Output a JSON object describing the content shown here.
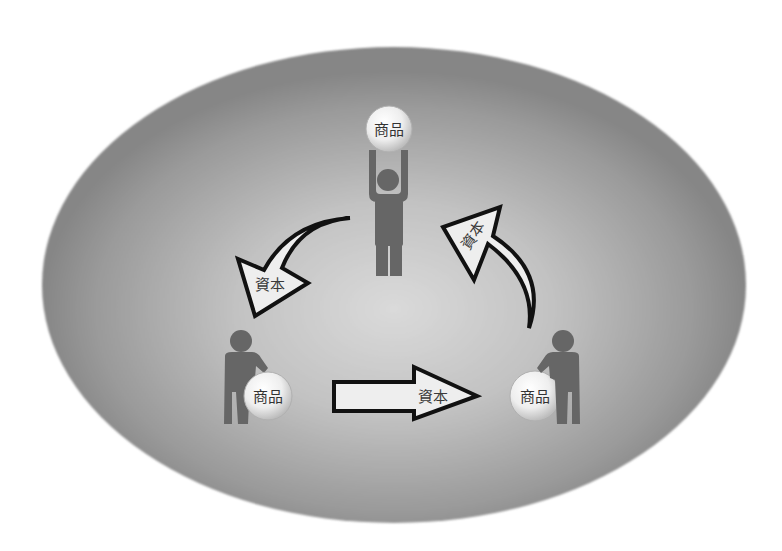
{
  "diagram": {
    "type": "circulation-of-capital-and-goods",
    "colors": {
      "background": "#ffffff",
      "ellipse_outer": "#8a8a8a",
      "ellipse_inner": "#d4d4d4",
      "figure": "#666666",
      "arrow_fill": "#eeeeee",
      "arrow_stroke": "#111111",
      "ball_fill": "#f2f2f2",
      "label_text": "#3a3a3a"
    },
    "nodes": [
      {
        "id": "top-person",
        "pose": "holding goods overhead",
        "ball_label": "商品"
      },
      {
        "id": "left-person",
        "pose": "leaning on goods",
        "ball_label": "商品"
      },
      {
        "id": "right-person",
        "pose": "leaning on goods",
        "ball_label": "商品"
      }
    ],
    "edges": [
      {
        "from": "top-person",
        "to": "left-person",
        "shape": "curved-arrow",
        "label": "資本"
      },
      {
        "from": "left-person",
        "to": "right-person",
        "shape": "straight-arrow",
        "label": "資本"
      },
      {
        "from": "right-person",
        "to": "top-person",
        "shape": "curved-arrow",
        "label": "資本"
      }
    ]
  }
}
